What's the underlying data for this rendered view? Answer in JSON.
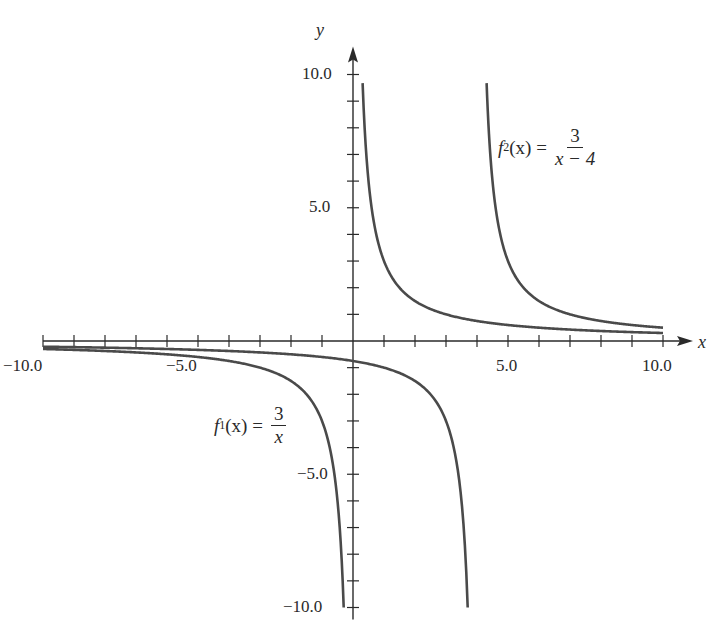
{
  "chart_data": {
    "type": "line",
    "title": "",
    "xlabel": "x",
    "ylabel": "y",
    "xlim": [
      -10,
      10
    ],
    "ylim": [
      -10,
      10
    ],
    "grid": false,
    "x_tick_step": 1,
    "y_tick_step": 1,
    "x_tick_labels": [
      "-10.0",
      "-5.0",
      "5.0",
      "10.0"
    ],
    "y_tick_labels": [
      "10.0",
      "5.0",
      "-5.0",
      "-10.0"
    ],
    "series": [
      {
        "name": "f1(x) = 3/x",
        "formula": "3/x",
        "asymptote_x": 0,
        "branches": [
          {
            "x_range": [
              -10,
              -0.3
            ],
            "points": [
              [
                -10,
                -0.3
              ],
              [
                -5,
                -0.6
              ],
              [
                -3,
                -1
              ],
              [
                -2,
                -1.5
              ],
              [
                -1,
                -3
              ],
              [
                -0.5,
                -6
              ],
              [
                -0.3,
                -10
              ]
            ]
          },
          {
            "x_range": [
              0.31,
              10
            ],
            "points": [
              [
                0.31,
                9.7
              ],
              [
                0.5,
                6
              ],
              [
                1,
                3
              ],
              [
                2,
                1.5
              ],
              [
                3,
                1
              ],
              [
                5,
                0.6
              ],
              [
                10,
                0.3
              ]
            ]
          }
        ]
      },
      {
        "name": "f2(x) = 3/(x-4)",
        "formula": "3/(x-4)",
        "asymptote_x": 4,
        "branches": [
          {
            "x_range": [
              -10,
              3.7
            ],
            "points": [
              [
                -10,
                -0.21
              ],
              [
                -5,
                -0.33
              ],
              [
                0,
                -0.75
              ],
              [
                2,
                -1.5
              ],
              [
                3,
                -3
              ],
              [
                3.5,
                -6
              ],
              [
                3.7,
                -10
              ]
            ]
          },
          {
            "x_range": [
              4.31,
              10
            ],
            "points": [
              [
                4.31,
                9.7
              ],
              [
                4.5,
                6
              ],
              [
                5,
                3
              ],
              [
                6,
                1.5
              ],
              [
                7,
                1
              ],
              [
                10,
                0.5
              ]
            ]
          }
        ]
      }
    ],
    "annotations": [
      {
        "text": "f2(x) = 3/(x − 4)",
        "near": [
          6.5,
          6.5
        ]
      },
      {
        "text": "f1(x) = 3/x",
        "near": [
          -3.5,
          -3
        ]
      }
    ],
    "legend": "none (inline labels)"
  },
  "labels": {
    "x_axis": "x",
    "y_axis": "y",
    "x_ticks": {
      "neg10": "−10.0",
      "neg5": "−5.0",
      "pos5": "5.0",
      "pos10": "10.0"
    },
    "y_ticks": {
      "pos10": "10.0",
      "pos5": "5.0",
      "neg5": "−5.0",
      "neg10": "−10.0"
    },
    "f2": {
      "name": "f",
      "sub": "2",
      "arg": "(x) =",
      "num": "3",
      "den": "x − 4"
    },
    "f1": {
      "name": "f",
      "sub": "1",
      "arg": "(x) =",
      "num": "3",
      "den": "x"
    }
  },
  "colors": {
    "axis": "#2a2a2a",
    "curve": "#4a4a4a"
  }
}
